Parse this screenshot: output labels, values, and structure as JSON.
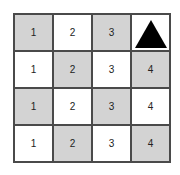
{
  "grid": {
    "rows": [
      [
        {
          "label": "1",
          "shade": "gray"
        },
        {
          "label": "2",
          "shade": "white"
        },
        {
          "label": "3",
          "shade": "gray"
        },
        {
          "label": "",
          "shade": "white",
          "marker": "triangle"
        }
      ],
      [
        {
          "label": "1",
          "shade": "white"
        },
        {
          "label": "2",
          "shade": "gray"
        },
        {
          "label": "3",
          "shade": "white"
        },
        {
          "label": "4",
          "shade": "gray"
        }
      ],
      [
        {
          "label": "1",
          "shade": "gray"
        },
        {
          "label": "2",
          "shade": "white"
        },
        {
          "label": "3",
          "shade": "gray"
        },
        {
          "label": "4",
          "shade": "white"
        }
      ],
      [
        {
          "label": "1",
          "shade": "white"
        },
        {
          "label": "2",
          "shade": "gray"
        },
        {
          "label": "3",
          "shade": "white"
        },
        {
          "label": "4",
          "shade": "gray"
        }
      ]
    ]
  },
  "colors": {
    "gray": "#d3d3d3",
    "white": "#ffffff",
    "border": "#4a4a4a",
    "marker": "#000000"
  }
}
